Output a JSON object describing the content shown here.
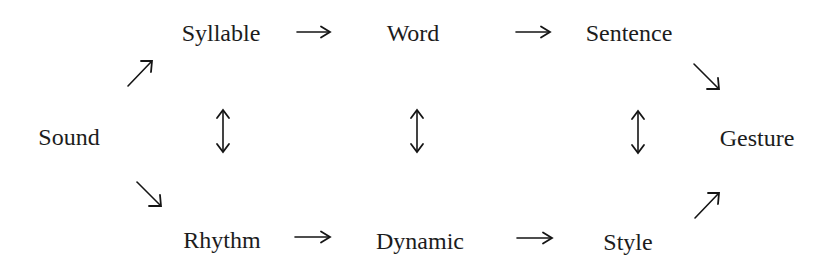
{
  "diagram": {
    "type": "flow-diagram",
    "nodes": {
      "sound": "Sound",
      "syllable": "Syllable",
      "word": "Word",
      "sentence": "Sentence",
      "gesture": "Gesture",
      "rhythm": "Rhythm",
      "dynamic": "Dynamic",
      "style": "Style"
    },
    "edges": [
      {
        "from": "Sound",
        "to": "Syllable",
        "type": "directed"
      },
      {
        "from": "Syllable",
        "to": "Word",
        "type": "directed"
      },
      {
        "from": "Word",
        "to": "Sentence",
        "type": "directed"
      },
      {
        "from": "Sentence",
        "to": "Gesture",
        "type": "directed"
      },
      {
        "from": "Sound",
        "to": "Rhythm",
        "type": "directed"
      },
      {
        "from": "Rhythm",
        "to": "Dynamic",
        "type": "directed"
      },
      {
        "from": "Dynamic",
        "to": "Style",
        "type": "directed"
      },
      {
        "from": "Style",
        "to": "Gesture",
        "type": "directed"
      },
      {
        "from": "Syllable",
        "to": "Rhythm",
        "type": "bidirectional"
      },
      {
        "from": "Word",
        "to": "Dynamic",
        "type": "bidirectional"
      },
      {
        "from": "Sentence",
        "to": "Style",
        "type": "bidirectional"
      }
    ],
    "colors": {
      "background": "#ffffff",
      "text": "#1c1c1c",
      "arrow": "#151515"
    }
  }
}
